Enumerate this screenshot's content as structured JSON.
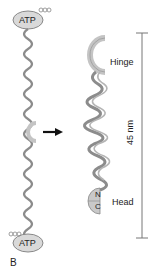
{
  "figure": {
    "panel_label": "B",
    "labels": {
      "atp_top": "ATP",
      "atp_bottom": "ATP",
      "hinge": "Hinge",
      "head": "Head",
      "n_terminus": "N",
      "c_terminus": "C",
      "scale": "45 nm"
    },
    "colors": {
      "helix": "#8c8c8c",
      "atp_fill": "#d9d9d9",
      "hinge": "#bdbdbd",
      "arrow": "#111111",
      "scale_bar": "#777777"
    }
  }
}
